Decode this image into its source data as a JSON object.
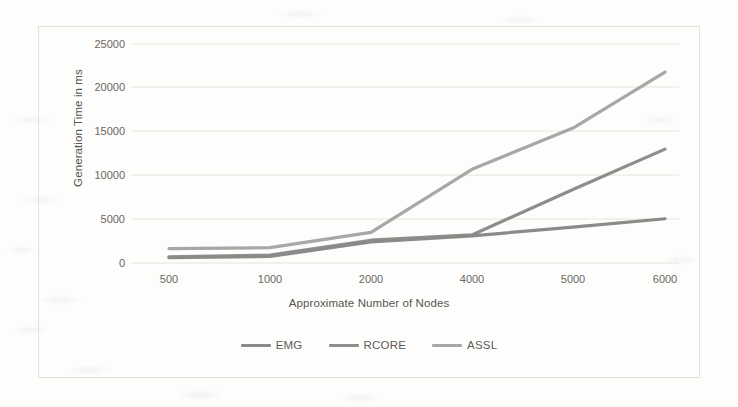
{
  "chart_data": {
    "type": "line",
    "title": "",
    "xlabel": "Approximate Number of Nodes",
    "ylabel": "Generation Time in ms",
    "categories": [
      "500",
      "1000",
      "2000",
      "4000",
      "5000",
      "6000"
    ],
    "x_tick_labels": [
      "500",
      "1000",
      "2000",
      "4000",
      "5000",
      "6000"
    ],
    "y_tick_labels": [
      "0",
      "5000",
      "10000",
      "15000",
      "20000",
      "25000"
    ],
    "y_ticks": [
      0,
      5000,
      10000,
      15000,
      20000,
      25000
    ],
    "ylim": [
      0,
      25000
    ],
    "grid": "horizontal",
    "legend_position": "bottom",
    "series": [
      {
        "name": "EMG",
        "color": "#8c8a88",
        "values": [
          600,
          750,
          2400,
          3100,
          4100,
          5050
        ]
      },
      {
        "name": "RCORE",
        "color": "#8f8d8b",
        "values": [
          700,
          900,
          2600,
          3200,
          8400,
          13000
        ]
      },
      {
        "name": "ASSL",
        "color": "#a9a7a5",
        "values": [
          1650,
          1750,
          3500,
          10700,
          15400,
          21800
        ]
      }
    ]
  },
  "legend": {
    "items": [
      {
        "label": "EMG",
        "color": "#8c8a88"
      },
      {
        "label": "RCORE",
        "color": "#8f8d8b"
      },
      {
        "label": "ASSL",
        "color": "#a9a7a5"
      }
    ]
  },
  "colors": {
    "background": "#fdfdfc",
    "frame_border": "#e3e1dd",
    "gridline": "#e6e4e1",
    "tick_text": "#6a6764",
    "axis_title_text": "#585552"
  }
}
